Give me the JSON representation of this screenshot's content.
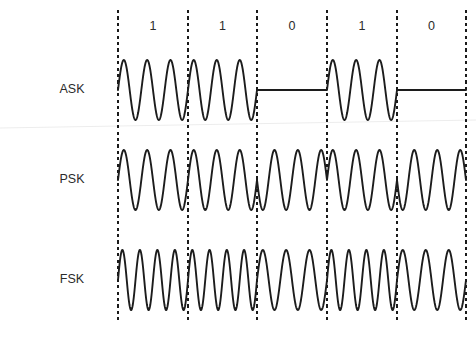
{
  "figure": {
    "width": 476,
    "height": 344,
    "background_color": "#ffffff",
    "stroke_color": "#1c1c1c",
    "boundary_color": "#1a1a1a",
    "text_color": "#2b2b2b",
    "faint_rule_color": "#ededed"
  },
  "bit_sequence": {
    "label_row_y": 27,
    "bits": [
      "1",
      "1",
      "0",
      "1",
      "0"
    ]
  },
  "boundaries": {
    "x_positions": [
      118,
      188,
      257,
      327,
      397,
      466
    ],
    "y_top": 10,
    "y_bottom": 320
  },
  "rows": [
    {
      "name": "ASK",
      "label": "ASK",
      "label_x": 72,
      "label_y": 90,
      "baseline_y": 90,
      "amplitude": 30,
      "cycles_per_bit_one": 3,
      "cycles_per_bit_zero": 0,
      "zero_is_flat": true
    },
    {
      "name": "PSK",
      "label": "PSK",
      "label_x": 72,
      "label_y": 180,
      "baseline_y": 180,
      "amplitude": 30,
      "cycles_per_bit_one": 3,
      "cycles_per_bit_zero": 3,
      "zero_is_flat": false,
      "phase_invert_on_zero": true
    },
    {
      "name": "FSK",
      "label": "FSK",
      "label_x": 72,
      "label_y": 280,
      "baseline_y": 280,
      "amplitude": 30,
      "cycles_per_bit_one": 4,
      "cycles_per_bit_zero": 3,
      "zero_is_flat": false
    }
  ],
  "faint_rule": {
    "x1": 0,
    "y1": 128,
    "x2": 476,
    "y2": 120
  },
  "chart_data": {
    "type": "line",
    "title": "",
    "xlabel": "",
    "ylabel": "",
    "legend": [
      "ASK",
      "PSK",
      "FSK"
    ],
    "categories": [
      "1",
      "1",
      "0",
      "1",
      "0"
    ],
    "series": [
      {
        "name": "ASK",
        "values": [
          1,
          1,
          0,
          1,
          0
        ],
        "description": "carrier present for bit 1, zero amplitude (flat) for bit 0"
      },
      {
        "name": "PSK",
        "values": [
          1,
          1,
          0,
          1,
          0
        ],
        "description": "constant amplitude and frequency, 180 degree phase reversal when bit changes"
      },
      {
        "name": "FSK",
        "values": [
          1,
          1,
          0,
          1,
          0
        ],
        "description": "constant amplitude, higher frequency (4 cycles) for bit 1, lower frequency (3 cycles) for bit 0"
      }
    ],
    "grid": false,
    "legend_position": "left"
  }
}
